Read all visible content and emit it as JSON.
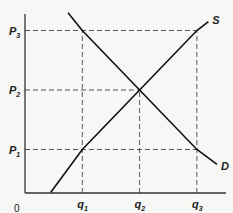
{
  "diagram": {
    "type": "supply-demand",
    "origin_label": "0",
    "price_levels": [
      {
        "label": "P",
        "sub": "1",
        "value": 1
      },
      {
        "label": "P",
        "sub": "2",
        "value": 2
      },
      {
        "label": "P",
        "sub": "3",
        "value": 3
      }
    ],
    "quantity_levels": [
      {
        "label": "q",
        "sub": "1",
        "value": 1
      },
      {
        "label": "q",
        "sub": "2",
        "value": 2
      },
      {
        "label": "q",
        "sub": "3",
        "value": 3
      }
    ],
    "curves": [
      {
        "name": "S",
        "kind": "supply",
        "points": [
          [
            0.45,
            0.28
          ],
          [
            1,
            1
          ],
          [
            2,
            2
          ],
          [
            3,
            3
          ],
          [
            3.2,
            3.15
          ]
        ]
      },
      {
        "name": "D",
        "kind": "demand",
        "points": [
          [
            0.75,
            3.3
          ],
          [
            1,
            3
          ],
          [
            2,
            2
          ],
          [
            3,
            1
          ],
          [
            3.35,
            0.75
          ]
        ]
      }
    ],
    "guides": [
      {
        "from": "P3",
        "to": "q3"
      },
      {
        "from": "P2",
        "to": "q2"
      },
      {
        "from": "P1",
        "to": "q3"
      },
      {
        "from": "q1",
        "to": "P3"
      },
      {
        "from": "q2",
        "to": "P2"
      },
      {
        "from": "q3",
        "to": "P3"
      }
    ]
  }
}
